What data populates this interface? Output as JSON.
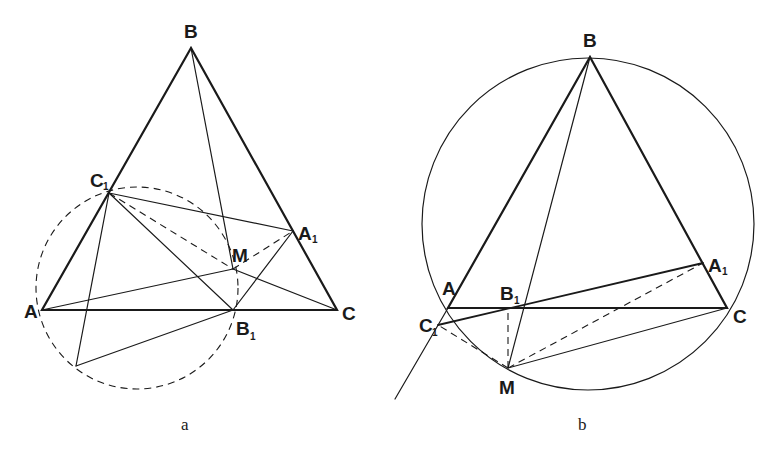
{
  "figures": [
    {
      "caption": "a",
      "points": {
        "B": {
          "label": "B",
          "sub": ""
        },
        "C1": {
          "label": "C",
          "sub": "1"
        },
        "A1": {
          "label": "A",
          "sub": "1"
        },
        "M": {
          "label": "M",
          "sub": ""
        },
        "A": {
          "label": "A",
          "sub": ""
        },
        "B1": {
          "label": "B",
          "sub": "1"
        },
        "C": {
          "label": "C",
          "sub": ""
        }
      },
      "circle_style": "dashed"
    },
    {
      "caption": "b",
      "points": {
        "B": {
          "label": "B",
          "sub": ""
        },
        "A1": {
          "label": "A",
          "sub": "1"
        },
        "A": {
          "label": "A",
          "sub": ""
        },
        "B1": {
          "label": "B",
          "sub": "1"
        },
        "C1": {
          "label": "C",
          "sub": "1"
        },
        "C": {
          "label": "C",
          "sub": ""
        },
        "M": {
          "label": "M",
          "sub": ""
        }
      },
      "circle_style": "solid"
    }
  ],
  "colors": {
    "ink": "#1a1a1a",
    "background": "#ffffff"
  }
}
